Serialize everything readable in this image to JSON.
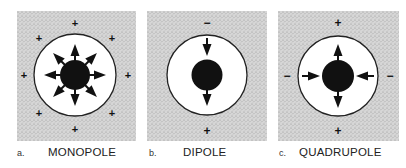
{
  "colors": {
    "background_stipple": "#d4d4d4",
    "stipple_dot": "#9a9a9a",
    "circle_fill": "#ffffff",
    "ink": "#111111"
  },
  "panels": [
    {
      "id": "a",
      "letter": "a.",
      "name": "MONOPOLE",
      "outer_signs": [
        "+",
        "+",
        "+",
        "+",
        "+",
        "+",
        "+",
        "+"
      ],
      "arrows": "8 outward radial arrows"
    },
    {
      "id": "b",
      "letter": "b.",
      "name": "DIPOLE",
      "outer_signs": [
        "−",
        "+"
      ],
      "arrows": "2 arrows both pointing downward (top and bottom)"
    },
    {
      "id": "c",
      "letter": "c.",
      "name": "QUADRUPOLE",
      "outer_signs": [
        "+",
        "−",
        "−",
        "+"
      ],
      "arrows": "top and bottom outward, left and right inward"
    }
  ]
}
